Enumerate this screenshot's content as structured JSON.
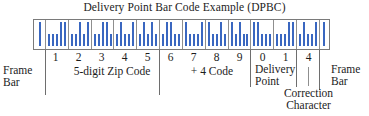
{
  "title": "Delivery Point Bar Code Example (DPBC)",
  "barcode": {
    "symbology": "POSTNET",
    "bar_color": "#3a67c0",
    "frame_bar_pattern": "1",
    "digits": [
      "1",
      "2",
      "3",
      "4",
      "5",
      "6",
      "7",
      "8",
      "9",
      "0",
      "1",
      "4"
    ],
    "encoding": {
      "0": "11000",
      "1": "00011",
      "2": "00101",
      "3": "00110",
      "4": "01001",
      "5": "01010",
      "6": "01100",
      "7": "10001",
      "8": "10010",
      "9": "10100"
    }
  },
  "groups": {
    "zip_code_digits": "12345",
    "plus4_digits": "6789",
    "delivery_point_digits": "01",
    "correction_digit": "4"
  },
  "annotations": {
    "frame_bar_left_line1": "Frame",
    "frame_bar_left_line2": "Bar",
    "zip_code_label": "5-digit Zip Code",
    "plus4_label": "+ 4 Code",
    "delivery_point_line1": "Delivery",
    "delivery_point_line2": "Point",
    "correction_line1": "Correction",
    "correction_line2": "Character",
    "frame_bar_right_line1": "Frame",
    "frame_bar_right_line2": "Bar"
  }
}
